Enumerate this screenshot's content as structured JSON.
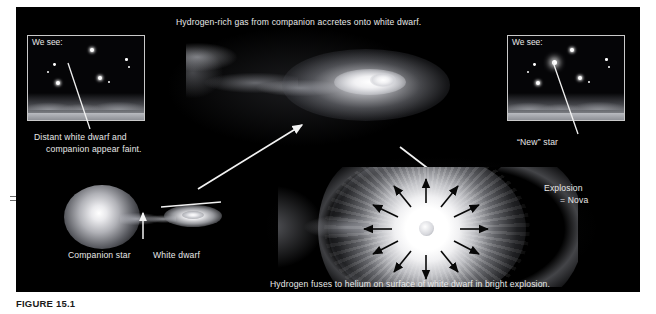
{
  "figure": {
    "caption": "FIGURE 15.1",
    "domain_kind": "astronomy-diagram",
    "background_color": "#000000",
    "text_color": "#e8e8e8",
    "panel_border_color": "#c9c9c9"
  },
  "labels": {
    "top_caption": "Hydrogen-rich gas from companion accretes onto white dwarf.",
    "bottom_caption": "Hydrogen fuses to helium on surface of white dwarf in bright explosion.",
    "left_inset_title": "We see:",
    "right_inset_title": "We see:",
    "left_inset_note_line1": "Distant white dwarf and",
    "left_inset_note_line2": "companion appear faint.",
    "right_inset_note": "“New” star",
    "companion_star": "Companion star",
    "white_dwarf": "White dwarf",
    "explosion_line1": "Explosion",
    "explosion_line2": "= Nova"
  },
  "scene": {
    "left_inset": {
      "title": "We see:",
      "stars": [
        {
          "x": 62,
          "y": 12,
          "r": 2.0,
          "bright": true
        },
        {
          "x": 97,
          "y": 22,
          "r": 1.3,
          "bright": false
        },
        {
          "x": 100,
          "y": 30,
          "r": 1.1,
          "bright": false
        },
        {
          "x": 25,
          "y": 27,
          "r": 1.4,
          "bright": false
        },
        {
          "x": 19,
          "y": 35,
          "r": 1.2,
          "bright": false
        },
        {
          "x": 28,
          "y": 45,
          "r": 2.0,
          "bright": true
        },
        {
          "x": 70,
          "y": 40,
          "r": 2.1,
          "bright": true
        },
        {
          "x": 80,
          "y": 45,
          "r": 1.1,
          "bright": false
        }
      ],
      "has_nova_star": false
    },
    "right_inset": {
      "title": "We see:",
      "stars": [
        {
          "x": 62,
          "y": 12,
          "r": 2.0,
          "bright": true
        },
        {
          "x": 97,
          "y": 22,
          "r": 1.3,
          "bright": false
        },
        {
          "x": 100,
          "y": 30,
          "r": 1.1,
          "bright": false
        },
        {
          "x": 25,
          "y": 27,
          "r": 1.4,
          "bright": false
        },
        {
          "x": 19,
          "y": 35,
          "r": 1.2,
          "bright": false
        },
        {
          "x": 28,
          "y": 45,
          "r": 2.0,
          "bright": true
        },
        {
          "x": 70,
          "y": 40,
          "r": 2.1,
          "bright": true
        },
        {
          "x": 80,
          "y": 45,
          "r": 1.1,
          "bright": false
        }
      ],
      "has_nova_star": true,
      "nova_star": {
        "x": 44,
        "y": 24,
        "r": 2.6
      }
    },
    "explosion": {
      "arrow_count": 12,
      "arrow_color": "#000000",
      "burst_color": "#ffffff"
    },
    "binary": {
      "companion_shape": "teardrop-roche-lobe",
      "white_dwarf_shape": "accretion-disk-ellipse"
    }
  }
}
